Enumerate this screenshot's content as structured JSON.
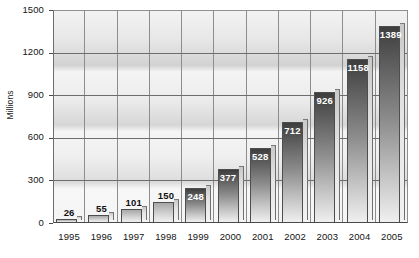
{
  "chart_data": {
    "type": "bar",
    "title": "",
    "xlabel": "",
    "ylabel": "Millions",
    "categories": [
      "1995",
      "1996",
      "1997",
      "1998",
      "1999",
      "2000",
      "2001",
      "2002",
      "2003",
      "2004",
      "2005"
    ],
    "values": [
      26,
      55,
      101,
      150,
      248,
      377,
      528,
      712,
      926,
      1158,
      1389
    ],
    "data_labels": [
      "26",
      "55",
      "101",
      "150",
      "248",
      "377",
      "528",
      "712",
      "926",
      "1158",
      "1389"
    ],
    "ylim": [
      0,
      1500
    ],
    "y_ticks": [
      0,
      300,
      600,
      900,
      1200,
      1500
    ],
    "y_tick_labels": [
      "0",
      "300",
      "600",
      "900",
      "1200",
      "1500"
    ],
    "grid": "horizontal-and-vertical",
    "legend": "none",
    "legend_position": "none",
    "orientation": "vertical",
    "style": "grayscale-3d",
    "colors": {
      "bar_top": "#3e3e3e",
      "bar_bottom": "#f0f0f0",
      "bar_side": "#d9d9d9",
      "plot_background": "#ececec",
      "gridline": "#6d6d6d",
      "axis_text": "#141414",
      "label_inside": "#ffffff",
      "label_outside": "#111111",
      "page_background": "#ffffff"
    }
  }
}
